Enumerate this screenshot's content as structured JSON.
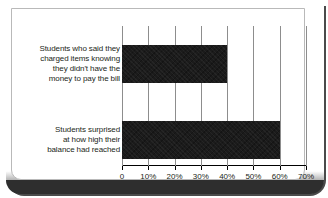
{
  "chart_data": {
    "type": "bar",
    "orientation": "horizontal",
    "title": "",
    "xlabel": "",
    "ylabel": "",
    "categories": [
      "Students who said they\ncharged items knowing\nthey didn't have the\nmoney to pay the bill",
      "Students surprised\nat how high their\nbalance had reached"
    ],
    "values": [
      40,
      60
    ],
    "value_unit": "%",
    "xlim": [
      0,
      70
    ],
    "xticks": [
      0,
      10,
      20,
      30,
      40,
      50,
      60,
      70
    ],
    "xtick_labels": [
      "0",
      "10%",
      "20%",
      "30%",
      "40%",
      "50%",
      "60%",
      "70%"
    ],
    "grid": "vertical",
    "legend": "none",
    "series": [
      {
        "name": "",
        "values": [
          40,
          60
        ],
        "color": "#1b1b1b"
      }
    ]
  },
  "colors": {
    "bar": "#1b1b1b",
    "gridline": "#8d8d8d",
    "axis": "#000000",
    "text": "#231f20",
    "card_background": "#ffffff",
    "card_border": "#b9b9b9",
    "outer_band": "#2e2e2e"
  }
}
